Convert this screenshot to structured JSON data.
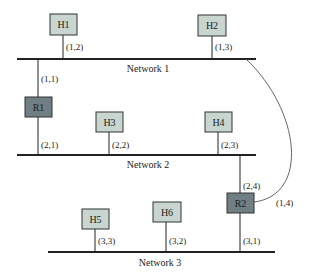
{
  "networks": [
    {
      "id": "net1",
      "label": "Network 1",
      "x1": 17,
      "x2": 256,
      "y": 59,
      "label_x": 148,
      "label_y": 72
    },
    {
      "id": "net2",
      "label": "Network 2",
      "x1": 17,
      "x2": 256,
      "y": 155,
      "label_x": 148,
      "label_y": 168
    },
    {
      "id": "net3",
      "label": "Network 3",
      "x1": 48,
      "x2": 275,
      "y": 252,
      "label_x": 160,
      "label_y": 266
    }
  ],
  "nodes": [
    {
      "id": "H1",
      "label": "H1",
      "type": "host",
      "x": 50,
      "y": 14,
      "w": 27,
      "h": 21,
      "line_x": 63,
      "line_y1": 35,
      "line_y2": 59,
      "addr": "(1,2)",
      "addr_x": 66,
      "addr_y": 50
    },
    {
      "id": "H2",
      "label": "H2",
      "type": "host",
      "x": 198,
      "y": 15,
      "w": 28,
      "h": 21,
      "line_x": 212,
      "line_y1": 36,
      "line_y2": 59,
      "addr": "(1,3)",
      "addr_x": 215,
      "addr_y": 50
    },
    {
      "id": "H3",
      "label": "H3",
      "type": "host",
      "x": 96,
      "y": 112,
      "w": 27,
      "h": 20,
      "line_x": 109,
      "line_y1": 132,
      "line_y2": 155,
      "addr": "(2,2)",
      "addr_x": 112,
      "addr_y": 148
    },
    {
      "id": "H4",
      "label": "H4",
      "type": "host",
      "x": 205,
      "y": 112,
      "w": 27,
      "h": 20,
      "line_x": 218,
      "line_y1": 132,
      "line_y2": 155,
      "addr": "(2,3)",
      "addr_x": 221,
      "addr_y": 148
    },
    {
      "id": "H5",
      "label": "H5",
      "type": "host",
      "x": 82,
      "y": 209,
      "w": 27,
      "h": 20,
      "line_x": 95,
      "line_y1": 229,
      "line_y2": 252,
      "addr": "(3,3)",
      "addr_x": 98,
      "addr_y": 244
    },
    {
      "id": "H6",
      "label": "H6",
      "type": "host",
      "x": 153,
      "y": 202,
      "w": 28,
      "h": 20,
      "line_x": 166,
      "line_y1": 222,
      "line_y2": 252,
      "addr": "(3,2)",
      "addr_x": 169,
      "addr_y": 244
    }
  ],
  "routers": [
    {
      "id": "R1",
      "label": "R1",
      "x": 25,
      "y": 97,
      "w": 27,
      "h": 20,
      "links": [
        {
          "x": 38,
          "y1": 59,
          "y2": 97,
          "addr": "(1,1)",
          "addr_x": 41,
          "addr_y": 82
        },
        {
          "x": 38,
          "y1": 117,
          "y2": 155,
          "addr": "(2,1)",
          "addr_x": 41,
          "addr_y": 148
        }
      ]
    },
    {
      "id": "R2",
      "label": "R2",
      "x": 227,
      "y": 193,
      "w": 27,
      "h": 20,
      "links": [
        {
          "x": 240,
          "y1": 155,
          "y2": 193,
          "addr": "(2,4)",
          "addr_x": 243,
          "addr_y": 189
        },
        {
          "x": 240,
          "y1": 213,
          "y2": 252,
          "addr": "(3,1)",
          "addr_x": 243,
          "addr_y": 244
        }
      ],
      "curve": {
        "path": "M 246 59 C 300 110, 310 195, 254 202",
        "addr": "(1,4)",
        "addr_x": 276,
        "addr_y": 206
      }
    }
  ],
  "colors": {
    "host_fill": "#c9d6cf",
    "router_fill": "#6f7f84",
    "stroke": "#333333",
    "line": "#222222"
  }
}
